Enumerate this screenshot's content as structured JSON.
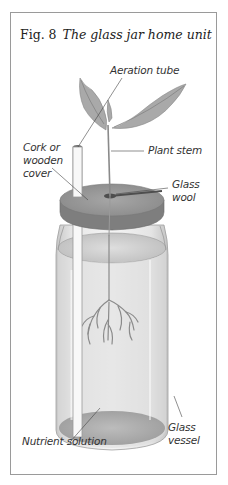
{
  "figure": {
    "number": "Fig. 8",
    "caption": "The glass jar home unit"
  },
  "labels": {
    "aeration_tube": "Aeration tube",
    "plant_stem": "Plant stem",
    "cork_line1": "Cork or",
    "cork_line2": "wooden",
    "cork_line3": "cover",
    "glass_wool_line1": "Glass",
    "glass_wool_line2": "wool",
    "nutrient_solution": "Nutrient solution",
    "glass_vessel_line1": "Glass",
    "glass_vessel_line2": "vessel"
  },
  "colors": {
    "frame": "#9a9a9a",
    "text": "#333333",
    "leaf": "#a8a8a8",
    "cork": "#8e8e8e",
    "liquid": "#d4d4d4"
  }
}
